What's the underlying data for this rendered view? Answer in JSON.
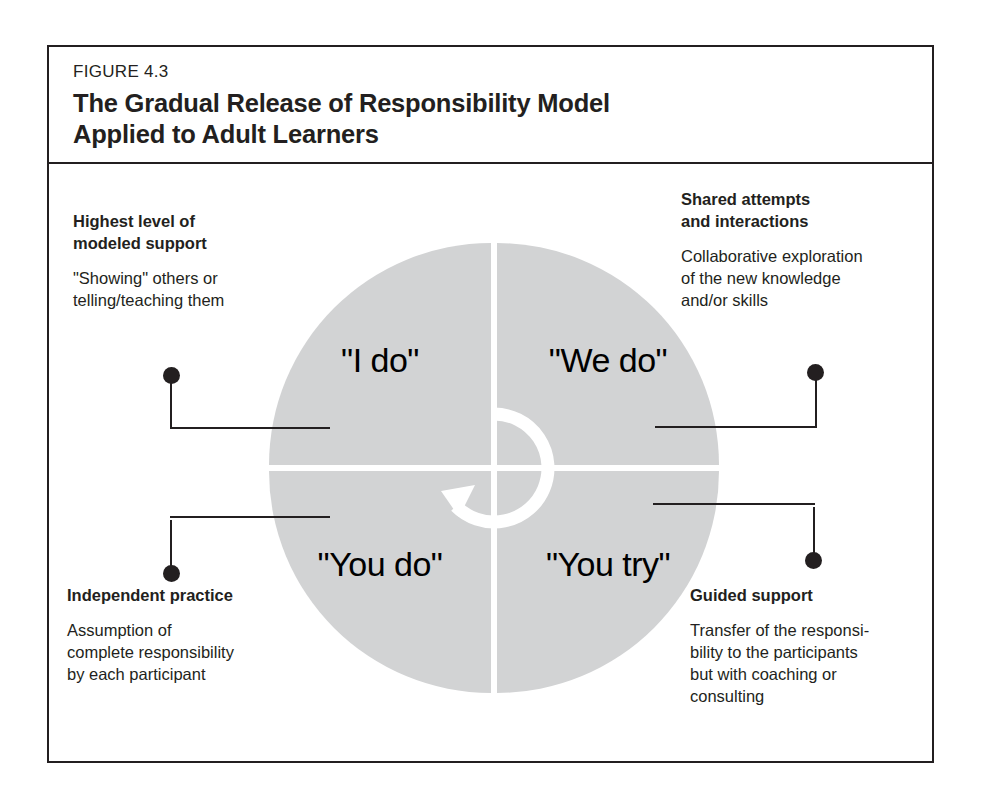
{
  "figure": {
    "number": "FIGURE 4.3",
    "title_lines": [
      "The Gradual Release of Responsibility Model",
      "Applied to Adult Learners"
    ],
    "colors": {
      "wheel_fill": "#d2d3d4",
      "ink": "#231f20",
      "background": "#ffffff"
    }
  },
  "wheel": {
    "quadrants": [
      {
        "position": "top-left",
        "label": "\"I do\""
      },
      {
        "position": "top-right",
        "label": "\"We do\""
      },
      {
        "position": "bottom-left",
        "label": "\"You do\""
      },
      {
        "position": "bottom-right",
        "label": "\"You try\""
      }
    ],
    "center_icon": "circular-arrow-icon"
  },
  "callouts": {
    "top_left": {
      "heading_lines": [
        "Highest level of",
        "modeled support"
      ],
      "body_lines": [
        "\"Showing\" others or",
        "telling/teaching them"
      ]
    },
    "top_right": {
      "heading_lines": [
        "Shared attempts",
        "and interactions"
      ],
      "body_lines": [
        "Collaborative exploration",
        "of the new knowledge",
        "and/or skills"
      ]
    },
    "bottom_left": {
      "heading_lines": [
        "Independent practice"
      ],
      "body_lines": [
        "Assumption of",
        "complete responsibility",
        "by each participant"
      ]
    },
    "bottom_right": {
      "heading_lines": [
        "Guided support"
      ],
      "body_lines": [
        "Transfer of the responsi-",
        "bility to the participants",
        "but with coaching or",
        "consulting"
      ]
    }
  }
}
